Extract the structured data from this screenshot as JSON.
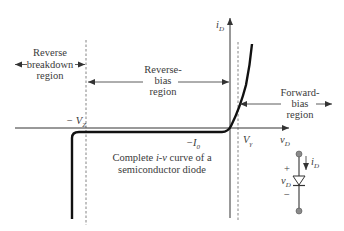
{
  "figure": {
    "caption_line1": "Complete i-v curve of a",
    "caption_line1_pre": "Complete ",
    "caption_line1_ital": "i-v",
    "caption_line1_post": " curve of a",
    "caption_line2": "semiconductor diode"
  },
  "axes": {
    "y_label_main": "i",
    "y_label_sub": "D",
    "x_label_main": "v",
    "x_label_sub": "D"
  },
  "markers": {
    "neg_vz_prefix": "− V",
    "neg_vz_sub": "Z",
    "neg_i0_prefix": "−I",
    "neg_i0_sub": "0",
    "vgamma_main": "V",
    "vgamma_sub": "γ"
  },
  "regions": {
    "reverse_breakdown": [
      "Reverse",
      "breakdown",
      "region"
    ],
    "reverse_bias": [
      "Reverse-",
      "bias",
      "region"
    ],
    "forward_bias": [
      "Forward-",
      "bias",
      "region"
    ]
  },
  "circuit": {
    "plus": "+",
    "minus": "−",
    "voltage_main": "v",
    "voltage_sub": "D",
    "current_main": "i",
    "current_sub": "D"
  },
  "colors": {
    "curve": "#111111",
    "axis": "#333333",
    "dashed": "#777777",
    "text": "#3a3a3a",
    "terminal": "#8a8a8a"
  }
}
